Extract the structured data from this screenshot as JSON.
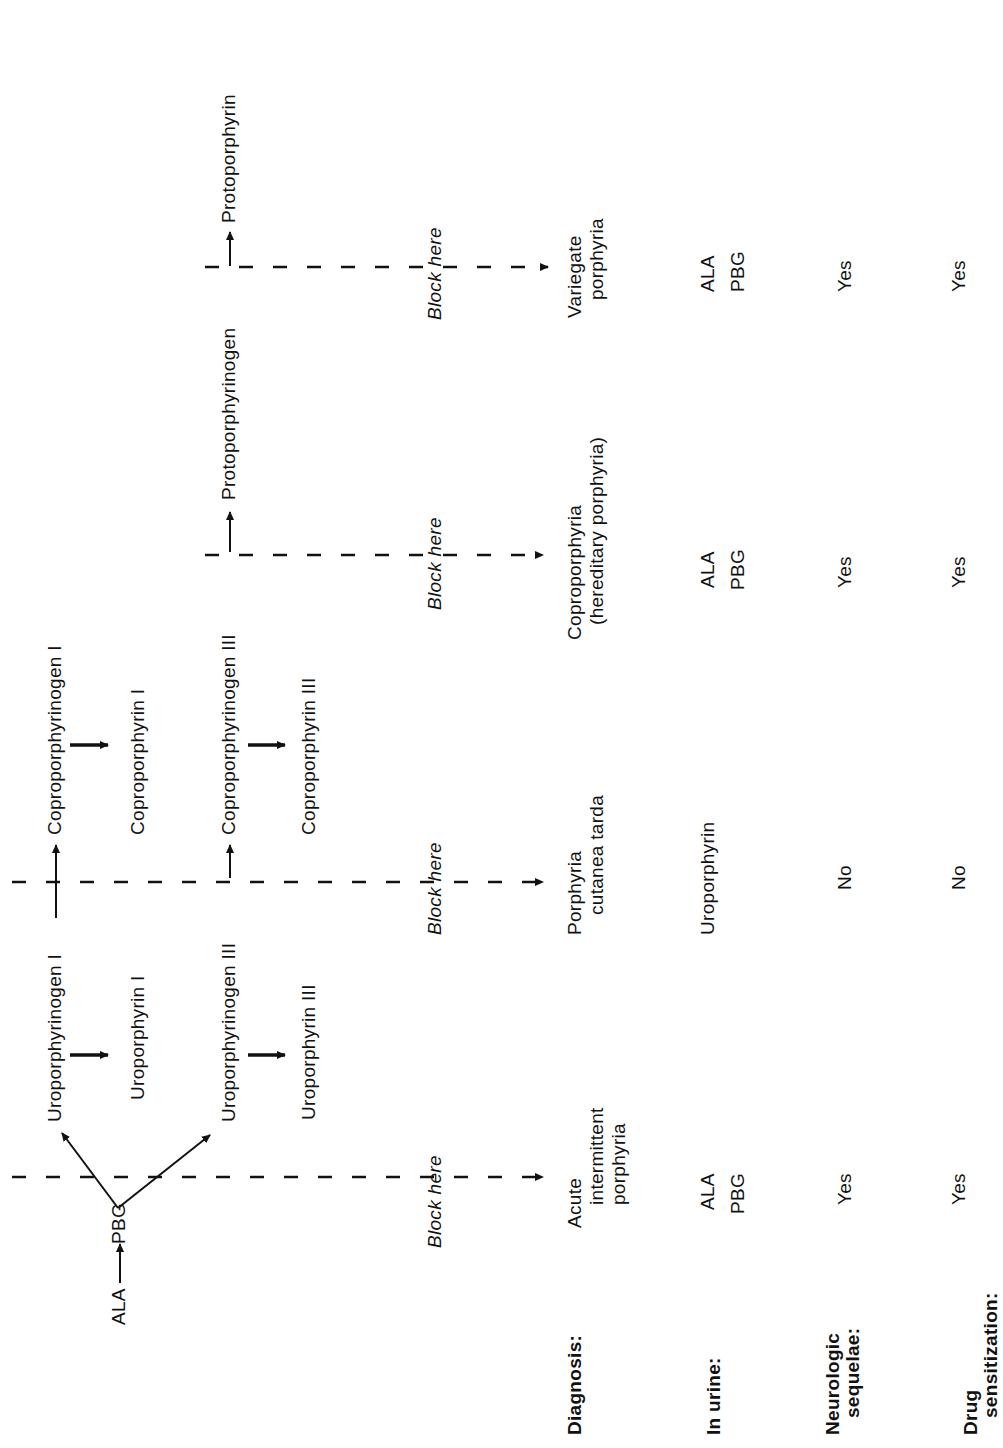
{
  "pathway": {
    "ala": "ALA",
    "pbg": "PBG",
    "uroporphyrinogen_1": "Uroporphyrinogen I",
    "uroporphyrin_1": "Uroporphyrin I",
    "coproporphyrinogen_1": "Coproporphyrinogen I",
    "coproporphyrin_1": "Coproporphyrin I",
    "uroporphyrinogen_3": "Uroporphyrinogen III",
    "uroporphyrin_3": "Uroporphyrin III",
    "coproporphyrinogen_3": "Coproporphyrinogen III",
    "coproporphyrin_3": "Coproporphyrin III",
    "protoporphyrinogen": "Protoporphyrinogen",
    "protoporphyrin": "Protoporphyrin"
  },
  "block_label": "Block here",
  "row_labels": {
    "diagnosis": "Diagnosis:",
    "in_urine": "In urine:",
    "neurologic_1": "Neurologic",
    "neurologic_2": "sequelae:",
    "drug_1": "Drug",
    "drug_2": "sensitization:"
  },
  "columns": [
    {
      "diagnosis": [
        "Acute",
        "intermittent",
        "porphyria"
      ],
      "urine": [
        "ALA",
        "PBG"
      ],
      "neurologic": "Yes",
      "drug": "Yes"
    },
    {
      "diagnosis": [
        "Porphyria",
        "cutanea tarda"
      ],
      "urine": [
        "Uroporphyrin"
      ],
      "neurologic": "No",
      "drug": "No"
    },
    {
      "diagnosis": [
        "Coproporphyria",
        "(hereditary porphyria)"
      ],
      "urine": [
        "ALA",
        "PBG"
      ],
      "neurologic": "Yes",
      "drug": "Yes"
    },
    {
      "diagnosis": [
        "Variegate",
        "porphyria"
      ],
      "urine": [
        "ALA",
        "PBG"
      ],
      "neurologic": "Yes",
      "drug": "Yes"
    }
  ]
}
